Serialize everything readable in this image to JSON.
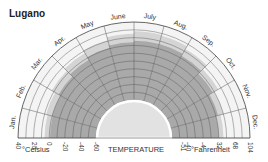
{
  "title": "Lugano",
  "chart_data": {
    "type": "polar-area",
    "title": "Lugano",
    "xlabel": "TEMPERATURE",
    "categories": [
      "Jan.",
      "Feb.",
      "Mar.",
      "Apr.",
      "May",
      "June",
      "July",
      "Aug.",
      "Sep.",
      "Oct.",
      "Nov.",
      "Dec."
    ],
    "series": [
      {
        "name": "Mean minimum (°C)",
        "values": [
          -1,
          0,
          3,
          7,
          11,
          14,
          16,
          16,
          13,
          8,
          3,
          0
        ]
      },
      {
        "name": "Mean maximum (°C)",
        "values": [
          6,
          8,
          13,
          17,
          21,
          25,
          28,
          27,
          23,
          16,
          10,
          6
        ]
      }
    ],
    "celsius_ticks": [
      "40",
      "20",
      "0",
      "-20",
      "-40",
      "-60"
    ],
    "fahrenheit_ticks": [
      "-51",
      "-40",
      "-4",
      "32",
      "68",
      "104"
    ],
    "celsius_label": "°Celsius",
    "fahrenheit_label": "°Fahrenheit",
    "rlim_celsius": [
      -60,
      40
    ],
    "grid": true,
    "colors": {
      "below_min": "#a9a9a9",
      "min_to_max": "#d4d4d4",
      "above_max": "#f4f4f4",
      "inner": "#e2e2e2",
      "grid": "#555555"
    }
  }
}
